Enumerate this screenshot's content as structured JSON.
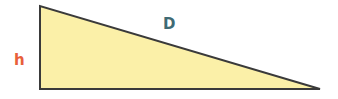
{
  "diagram": {
    "type": "right-triangle",
    "labels": {
      "height": "h",
      "hypotenuse": "D"
    },
    "colors": {
      "fill": "#fbf0a8",
      "stroke": "#3a3a3a",
      "height_label": "#e8603a",
      "hypotenuse_label": "#3f6a74"
    }
  }
}
